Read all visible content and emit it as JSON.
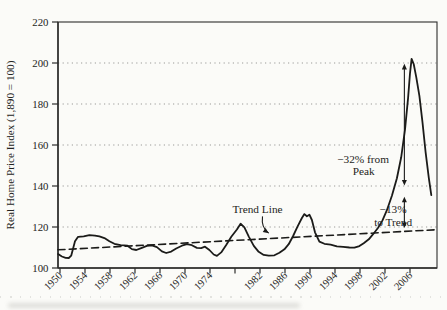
{
  "page": {
    "background": "#fbfbf8",
    "ink": "#1b1b19",
    "text_color": "#242422",
    "grid_color": "#9c9c98",
    "frame_color": "#2e2e2c"
  },
  "chart_data": {
    "type": "line",
    "title": "",
    "xlabel": "",
    "ylabel": "Real Home Price Index (1,890 = 100)",
    "ylim": [
      100,
      220
    ],
    "yticks": [
      100,
      120,
      140,
      160,
      180,
      200,
      220
    ],
    "xlim": [
      1949.68,
      2010.32
    ],
    "xticks": [
      1950,
      1954,
      1958,
      1962,
      1966,
      1970,
      1974,
      1978,
      1982,
      1986,
      1990,
      1994,
      1998,
      2002,
      2006
    ],
    "xtick_labels": [
      "1950",
      "1954",
      "1958",
      "1962",
      "1966",
      "1970",
      "1974",
      "",
      "1982",
      "1986",
      "1990",
      "1994",
      "1998",
      "2002",
      "2006"
    ],
    "grid": "horizontal-dotted",
    "legend": "none",
    "series": [
      {
        "name": "Real Home Price Index",
        "style": "solid",
        "points": [
          [
            1949.7,
            106.8
          ],
          [
            1950.3,
            105.6
          ],
          [
            1950.9,
            105.0
          ],
          [
            1951.4,
            104.9
          ],
          [
            1951.8,
            106.0
          ],
          [
            1952.4,
            113.0
          ],
          [
            1952.9,
            115.2
          ],
          [
            1953.8,
            115.4
          ],
          [
            1954.7,
            116.0
          ],
          [
            1955.6,
            115.8
          ],
          [
            1956.3,
            115.4
          ],
          [
            1957.1,
            114.6
          ],
          [
            1957.9,
            113.0
          ],
          [
            1958.7,
            111.8
          ],
          [
            1959.7,
            111.1
          ],
          [
            1960.8,
            110.9
          ],
          [
            1961.5,
            109.2
          ],
          [
            1962.2,
            108.8
          ],
          [
            1963.0,
            109.7
          ],
          [
            1963.9,
            110.8
          ],
          [
            1964.7,
            111.0
          ],
          [
            1965.5,
            110.2
          ],
          [
            1966.3,
            108.1
          ],
          [
            1967.0,
            107.3
          ],
          [
            1967.8,
            108.0
          ],
          [
            1968.6,
            109.5
          ],
          [
            1969.5,
            110.9
          ],
          [
            1970.3,
            111.6
          ],
          [
            1971.1,
            111.1
          ],
          [
            1971.9,
            109.8
          ],
          [
            1972.6,
            109.7
          ],
          [
            1973.2,
            110.4
          ],
          [
            1973.9,
            108.8
          ],
          [
            1974.6,
            106.6
          ],
          [
            1975.1,
            105.9
          ],
          [
            1975.8,
            107.6
          ],
          [
            1976.6,
            111.2
          ],
          [
            1977.4,
            115.2
          ],
          [
            1978.3,
            118.8
          ],
          [
            1978.9,
            121.6
          ],
          [
            1979.5,
            119.8
          ],
          [
            1980.2,
            115.3
          ],
          [
            1981.0,
            110.8
          ],
          [
            1981.8,
            107.9
          ],
          [
            1982.6,
            106.4
          ],
          [
            1983.4,
            106.0
          ],
          [
            1984.3,
            106.2
          ],
          [
            1985.1,
            107.4
          ],
          [
            1985.9,
            109.1
          ],
          [
            1986.6,
            111.6
          ],
          [
            1987.3,
            115.6
          ],
          [
            1988.0,
            120.2
          ],
          [
            1988.7,
            124.4
          ],
          [
            1989.1,
            126.3
          ],
          [
            1989.5,
            125.2
          ],
          [
            1989.9,
            126.0
          ],
          [
            1990.3,
            123.4
          ],
          [
            1990.8,
            117.4
          ],
          [
            1991.5,
            112.9
          ],
          [
            1992.3,
            111.8
          ],
          [
            1993.3,
            111.4
          ],
          [
            1994.3,
            110.6
          ],
          [
            1995.3,
            110.3
          ],
          [
            1996.3,
            110.0
          ],
          [
            1997.1,
            109.9
          ],
          [
            1997.9,
            110.7
          ],
          [
            1998.6,
            112.1
          ],
          [
            1999.4,
            114.0
          ],
          [
            2000.1,
            116.5
          ],
          [
            2000.9,
            119.6
          ],
          [
            2001.6,
            123.2
          ],
          [
            2002.3,
            128.2
          ],
          [
            2003.1,
            135.2
          ],
          [
            2003.9,
            143.8
          ],
          [
            2004.6,
            154.0
          ],
          [
            2005.2,
            167.5
          ],
          [
            2005.7,
            183.0
          ],
          [
            2006.0,
            195.0
          ],
          [
            2006.25,
            202.0
          ],
          [
            2006.6,
            199.5
          ],
          [
            2007.0,
            193.0
          ],
          [
            2007.5,
            184.0
          ],
          [
            2008.0,
            171.0
          ],
          [
            2008.5,
            156.5
          ],
          [
            2009.0,
            144.0
          ],
          [
            2009.4,
            135.5
          ]
        ]
      },
      {
        "name": "Trend Line",
        "style": "dashed",
        "points": [
          [
            1949.68,
            108.9
          ],
          [
            2010.32,
            118.7
          ]
        ]
      }
    ],
    "labels": [
      {
        "name": "trend-line-label",
        "text": "Trend Line",
        "at": [
          1981.6,
          128.6
        ]
      },
      {
        "name": "peak-drop-label-line-1",
        "text": "−32% from",
        "at": [
          1998.5,
          153.3
        ]
      },
      {
        "name": "peak-drop-label-line-2",
        "text": "Peak",
        "at": [
          1998.6,
          147.3
        ]
      },
      {
        "name": "trend-drop-label-line-1",
        "text": "−13%",
        "at": [
          2003.3,
          128.7
        ]
      },
      {
        "name": "trend-drop-label-line-2",
        "text": "to Trend",
        "at": [
          2003.3,
          122.3
        ]
      }
    ],
    "arrows": [
      {
        "name": "trend-line-pointer-arrow",
        "type": "curved",
        "from": [
          1982.4,
          125.2
        ],
        "to": [
          1983.4,
          117.0
        ]
      },
      {
        "name": "peak-to-140-arrow",
        "type": "double-vertical",
        "x": 2005.1,
        "from": 199.6,
        "to": 140.2
      },
      {
        "name": "140-to-trend-arrow",
        "type": "double-vertical",
        "x": 2005.1,
        "from": 134.8,
        "to": 119.5
      }
    ]
  }
}
